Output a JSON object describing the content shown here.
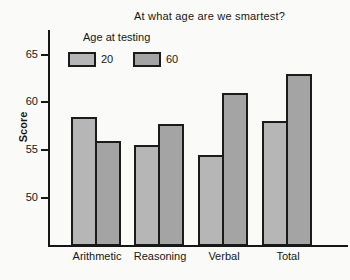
{
  "chart_data": {
    "type": "bar",
    "title": "At what age are we smartest?",
    "legend_title": "Age at testing",
    "legend_position": "top-left",
    "categories": [
      "Arithmetic",
      "Reasoning",
      "Verbal",
      "Total"
    ],
    "series": [
      {
        "name": "20",
        "color": "#b6b6b6",
        "values": [
          58.5,
          55.5,
          54.5,
          58.0
        ]
      },
      {
        "name": "60",
        "color": "#a4a4a4",
        "values": [
          56.0,
          57.7,
          61.0,
          63.0
        ]
      }
    ],
    "xlabel": "",
    "ylabel": "Score",
    "ylim": [
      45,
      67.5
    ],
    "yticks": [
      50,
      55,
      60,
      65
    ],
    "grid": false,
    "bar_border_color": "#1b1b1b",
    "axis_color": "#161616",
    "background_color": "#fafaf8"
  }
}
